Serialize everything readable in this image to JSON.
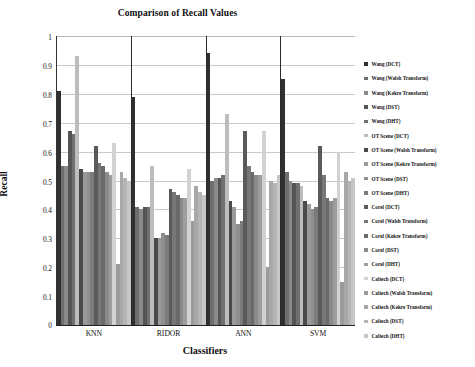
{
  "chart_data": {
    "type": "bar",
    "title": "Comparison of Recall Values",
    "xlabel": "Classifiers",
    "ylabel": "Recall",
    "ylim": [
      0,
      1
    ],
    "ytick_step": 0.1,
    "ytick_labels": [
      "1",
      "0.9",
      "0.8",
      "0.7",
      "0.6",
      "0.5",
      "0.4",
      "0.3",
      "0.2",
      "0.1",
      "0"
    ],
    "grid": true,
    "legend_position": "right",
    "categories": [
      "KNN",
      "RIDOR",
      "ANN",
      "SVM"
    ],
    "series": [
      {
        "name": "Wang (DCT)",
        "color": "#303030",
        "values": [
          0.81,
          0.79,
          0.94,
          0.85
        ]
      },
      {
        "name": "Wang (Walsh Transform)",
        "color": "#6e6e6e",
        "values": [
          0.55,
          0.41,
          0.5,
          0.53
        ]
      },
      {
        "name": "Wang (Kekre Transform)",
        "color": "#8a8a8a",
        "values": [
          0.55,
          0.4,
          0.51,
          0.5
        ]
      },
      {
        "name": "Wang (DST)",
        "color": "#555555",
        "values": [
          0.67,
          0.41,
          0.51,
          0.49
        ]
      },
      {
        "name": "Wang (DHT)",
        "color": "#707070",
        "values": [
          0.66,
          0.41,
          0.52,
          0.49
        ]
      },
      {
        "name": "OT Scene (DCT)",
        "color": "#bdbdbd",
        "values": [
          0.93,
          0.55,
          0.73,
          0.48
        ]
      },
      {
        "name": "OT Scene (Walsh Transform)",
        "color": "#4a4a4a",
        "values": [
          0.54,
          0.3,
          0.43,
          0.43
        ]
      },
      {
        "name": "OT Scene (Kekre Transform)",
        "color": "#9a9a9a",
        "values": [
          0.53,
          0.3,
          0.41,
          0.42
        ]
      },
      {
        "name": "OT Scene (DST)",
        "color": "#8f8f8f",
        "values": [
          0.53,
          0.32,
          0.35,
          0.4
        ]
      },
      {
        "name": "OT Scene (DHT)",
        "color": "#7b7b7b",
        "values": [
          0.53,
          0.31,
          0.36,
          0.41
        ]
      },
      {
        "name": "Corel (DCT)",
        "color": "#5a5a5a",
        "values": [
          0.62,
          0.47,
          0.67,
          0.62
        ]
      },
      {
        "name": "Corel (Walsh Transform)",
        "color": "#777777",
        "values": [
          0.56,
          0.46,
          0.55,
          0.52
        ]
      },
      {
        "name": "Corel (Kekre Transform)",
        "color": "#6a6a6a",
        "values": [
          0.55,
          0.45,
          0.53,
          0.44
        ]
      },
      {
        "name": "Corel (DST)",
        "color": "#8b8b8b",
        "values": [
          0.53,
          0.44,
          0.52,
          0.43
        ]
      },
      {
        "name": "Corel (DHT)",
        "color": "#9e9e9e",
        "values": [
          0.52,
          0.44,
          0.52,
          0.44
        ]
      },
      {
        "name": "Caltech (DCT)",
        "color": "#d2d2d2",
        "values": [
          0.63,
          0.54,
          0.67,
          0.6
        ]
      },
      {
        "name": "Caltech (Walsh Transform)",
        "color": "#9b9b9b",
        "values": [
          0.21,
          0.36,
          0.2,
          0.15
        ]
      },
      {
        "name": "Caltech (Kekre Transform)",
        "color": "#a8a8a8",
        "values": [
          0.53,
          0.48,
          0.5,
          0.53
        ]
      },
      {
        "name": "Caltech (DST)",
        "color": "#b5b5b5",
        "values": [
          0.51,
          0.46,
          0.49,
          0.5
        ]
      },
      {
        "name": "Caltech (DHT)",
        "color": "#c6c6c6",
        "values": [
          0.5,
          0.45,
          0.52,
          0.51
        ]
      }
    ]
  }
}
